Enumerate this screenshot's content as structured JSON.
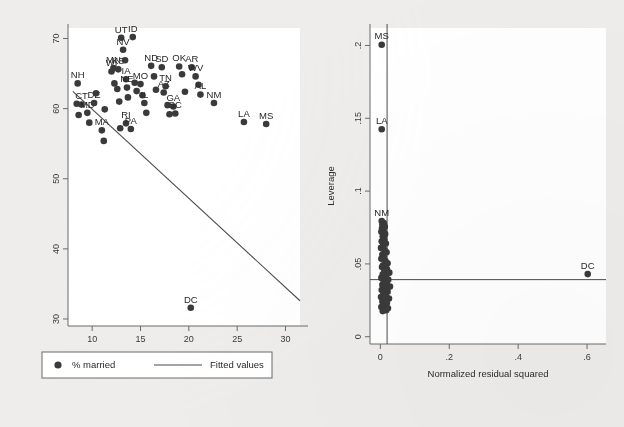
{
  "figure": {
    "background_color": "#eeedeb",
    "plot_background_color": "#ffffff",
    "marker_color": "#3a3a3a",
    "line_color": "#4a4a4a",
    "axis_color": "#6b6b6b"
  },
  "chart_data": [
    {
      "id": "left-panel",
      "type": "scatter",
      "title": "",
      "xlabel": "% in poverty",
      "ylabel": "",
      "xlim": [
        7.5,
        31.5
      ],
      "ylim": [
        29,
        71.5
      ],
      "xticks": [
        "10",
        "15",
        "20",
        "25",
        "30"
      ],
      "xtick_values": [
        10,
        15,
        20,
        25,
        30
      ],
      "yticks": [
        "30",
        "40",
        "50",
        "60",
        "70"
      ],
      "ytick_values": [
        30,
        40,
        50,
        60,
        70
      ],
      "grid": false,
      "legend_position": "below-axis",
      "legend": [
        {
          "label": "% married",
          "marker": "filled-circle"
        },
        {
          "label": "Fitted values",
          "marker": "line"
        }
      ],
      "fit_line": {
        "x": [
          8.0,
          31.5
        ],
        "y": [
          62.45,
          32.6
        ],
        "note": "fitted values line"
      },
      "points": [
        {
          "label": "NH",
          "x": 8.5,
          "y": 63.6
        },
        {
          "label": "",
          "x": 8.4,
          "y": 60.7
        },
        {
          "label": "",
          "x": 8.6,
          "y": 59.1
        },
        {
          "label": "CT",
          "x": 8.9,
          "y": 60.6
        },
        {
          "label": "MD",
          "x": 9.5,
          "y": 59.4
        },
        {
          "label": "",
          "x": 9.7,
          "y": 58.0
        },
        {
          "label": "DE",
          "x": 10.2,
          "y": 60.8
        },
        {
          "label": "",
          "x": 10.4,
          "y": 62.2
        },
        {
          "label": "MA",
          "x": 11.0,
          "y": 56.9
        },
        {
          "label": "",
          "x": 11.2,
          "y": 55.4
        },
        {
          "label": "",
          "x": 11.3,
          "y": 59.9
        },
        {
          "label": "WI",
          "x": 12.0,
          "y": 65.3
        },
        {
          "label": "MN",
          "x": 12.2,
          "y": 65.8
        },
        {
          "label": "",
          "x": 12.3,
          "y": 63.6
        },
        {
          "label": "KS",
          "x": 12.7,
          "y": 65.6
        },
        {
          "label": "",
          "x": 12.6,
          "y": 62.8
        },
        {
          "label": "",
          "x": 12.8,
          "y": 61.0
        },
        {
          "label": "",
          "x": 12.9,
          "y": 57.2
        },
        {
          "label": "NV",
          "x": 13.2,
          "y": 68.4
        },
        {
          "label": "",
          "x": 13.4,
          "y": 66.9
        },
        {
          "label": "IA",
          "x": 13.5,
          "y": 64.2
        },
        {
          "label": "NE",
          "x": 13.6,
          "y": 63.0
        },
        {
          "label": "",
          "x": 13.7,
          "y": 61.6
        },
        {
          "label": "RI",
          "x": 13.5,
          "y": 57.9
        },
        {
          "label": "PA",
          "x": 14.0,
          "y": 57.1
        },
        {
          "label": "UT",
          "x": 13.0,
          "y": 70.1
        },
        {
          "label": "ID",
          "x": 14.2,
          "y": 70.2
        },
        {
          "label": "",
          "x": 14.4,
          "y": 63.7
        },
        {
          "label": "",
          "x": 14.6,
          "y": 62.5
        },
        {
          "label": "MO",
          "x": 15.0,
          "y": 63.5
        },
        {
          "label": "",
          "x": 15.2,
          "y": 61.9
        },
        {
          "label": "IL",
          "x": 15.4,
          "y": 60.8
        },
        {
          "label": "",
          "x": 15.6,
          "y": 59.4
        },
        {
          "label": "ND",
          "x": 16.1,
          "y": 66.1
        },
        {
          "label": "",
          "x": 16.4,
          "y": 64.6
        },
        {
          "label": "",
          "x": 16.6,
          "y": 62.7
        },
        {
          "label": "SD",
          "x": 17.2,
          "y": 65.9
        },
        {
          "label": "AZ",
          "x": 17.4,
          "y": 62.3
        },
        {
          "label": "TN",
          "x": 17.6,
          "y": 63.2
        },
        {
          "label": "",
          "x": 17.8,
          "y": 60.5
        },
        {
          "label": "",
          "x": 18.0,
          "y": 59.2
        },
        {
          "label": "GA",
          "x": 18.4,
          "y": 60.3
        },
        {
          "label": "SC",
          "x": 18.6,
          "y": 59.3
        },
        {
          "label": "OK",
          "x": 19.0,
          "y": 66.0
        },
        {
          "label": "",
          "x": 19.3,
          "y": 64.9
        },
        {
          "label": "",
          "x": 19.6,
          "y": 62.4
        },
        {
          "label": "AR",
          "x": 20.3,
          "y": 65.9
        },
        {
          "label": "WV",
          "x": 20.7,
          "y": 64.6
        },
        {
          "label": "",
          "x": 21.0,
          "y": 63.4
        },
        {
          "label": "AL",
          "x": 21.2,
          "y": 62.0
        },
        {
          "label": "NM",
          "x": 22.6,
          "y": 60.8
        },
        {
          "label": "LA",
          "x": 25.7,
          "y": 58.1
        },
        {
          "label": "MS",
          "x": 28.0,
          "y": 57.8
        },
        {
          "label": "DC",
          "x": 20.2,
          "y": 31.6
        }
      ],
      "annotated_labels": [
        "NH",
        "CT",
        "MD",
        "DE",
        "MA",
        "WI",
        "MN",
        "KS",
        "NV",
        "IA",
        "NE",
        "RI",
        "PA",
        "UT",
        "ID",
        "MO",
        "IL",
        "ND",
        "SD",
        "AZ",
        "TN",
        "GA",
        "SC",
        "OK",
        "AR",
        "WV",
        "AL",
        "NM",
        "LA",
        "MS",
        "DC"
      ]
    },
    {
      "id": "right-panel",
      "type": "scatter",
      "title": "",
      "xlabel": "Normalized residual squared",
      "ylabel": "Leverage",
      "xlim": [
        -0.03,
        0.655
      ],
      "ylim": [
        -0.005,
        0.212
      ],
      "xticks": [
        "0",
        ".2",
        ".4",
        ".6"
      ],
      "xtick_values": [
        0,
        0.2,
        0.4,
        0.6
      ],
      "yticks": [
        "0",
        ".05",
        ".1",
        ".15",
        ".2"
      ],
      "ytick_values": [
        0,
        0.05,
        0.1,
        0.15,
        0.2
      ],
      "grid": false,
      "reference_lines": {
        "horizontal_y": 0.0392,
        "vertical_x": 0.0196
      },
      "points": [
        {
          "label": "MS",
          "x": 0.004,
          "y": 0.2005
        },
        {
          "label": "LA",
          "x": 0.004,
          "y": 0.1425
        },
        {
          "label": "NM",
          "x": 0.004,
          "y": 0.0795
        },
        {
          "label": "",
          "x": 0.01,
          "y": 0.078
        },
        {
          "label": "",
          "x": 0.006,
          "y": 0.077
        },
        {
          "label": "",
          "x": 0.013,
          "y": 0.0755
        },
        {
          "label": "",
          "x": 0.005,
          "y": 0.0745
        },
        {
          "label": "",
          "x": 0.009,
          "y": 0.073
        },
        {
          "label": "",
          "x": 0.003,
          "y": 0.072
        },
        {
          "label": "",
          "x": 0.014,
          "y": 0.0705
        },
        {
          "label": "",
          "x": 0.007,
          "y": 0.069
        },
        {
          "label": "",
          "x": 0.011,
          "y": 0.067
        },
        {
          "label": "",
          "x": 0.004,
          "y": 0.0655
        },
        {
          "label": "",
          "x": 0.016,
          "y": 0.064
        },
        {
          "label": "",
          "x": 0.008,
          "y": 0.0625
        },
        {
          "label": "",
          "x": 0.002,
          "y": 0.061
        },
        {
          "label": "",
          "x": 0.012,
          "y": 0.0595
        },
        {
          "label": "",
          "x": 0.018,
          "y": 0.058
        },
        {
          "label": "",
          "x": 0.006,
          "y": 0.0565
        },
        {
          "label": "",
          "x": 0.01,
          "y": 0.055
        },
        {
          "label": "",
          "x": 0.003,
          "y": 0.0535
        },
        {
          "label": "",
          "x": 0.015,
          "y": 0.052
        },
        {
          "label": "",
          "x": 0.021,
          "y": 0.0505
        },
        {
          "label": "",
          "x": 0.008,
          "y": 0.049
        },
        {
          "label": "",
          "x": 0.005,
          "y": 0.0478
        },
        {
          "label": "",
          "x": 0.019,
          "y": 0.0465
        },
        {
          "label": "",
          "x": 0.012,
          "y": 0.0452
        },
        {
          "label": "",
          "x": 0.026,
          "y": 0.044
        },
        {
          "label": "",
          "x": 0.007,
          "y": 0.0428
        },
        {
          "label": "",
          "x": 0.016,
          "y": 0.0416
        },
        {
          "label": "",
          "x": 0.003,
          "y": 0.0404
        },
        {
          "label": "",
          "x": 0.023,
          "y": 0.0392
        },
        {
          "label": "",
          "x": 0.01,
          "y": 0.038
        },
        {
          "label": "",
          "x": 0.018,
          "y": 0.0368
        },
        {
          "label": "",
          "x": 0.006,
          "y": 0.0356
        },
        {
          "label": "",
          "x": 0.028,
          "y": 0.0344
        },
        {
          "label": "",
          "x": 0.013,
          "y": 0.0332
        },
        {
          "label": "",
          "x": 0.004,
          "y": 0.032
        },
        {
          "label": "",
          "x": 0.021,
          "y": 0.0308
        },
        {
          "label": "",
          "x": 0.009,
          "y": 0.0296
        },
        {
          "label": "",
          "x": 0.016,
          "y": 0.0284
        },
        {
          "label": "",
          "x": 0.002,
          "y": 0.0272
        },
        {
          "label": "",
          "x": 0.025,
          "y": 0.0262
        },
        {
          "label": "",
          "x": 0.011,
          "y": 0.0252
        },
        {
          "label": "",
          "x": 0.006,
          "y": 0.0242
        },
        {
          "label": "",
          "x": 0.019,
          "y": 0.0232
        },
        {
          "label": "",
          "x": 0.014,
          "y": 0.0222
        },
        {
          "label": "",
          "x": 0.008,
          "y": 0.0212
        },
        {
          "label": "",
          "x": 0.003,
          "y": 0.0204
        },
        {
          "label": "",
          "x": 0.022,
          "y": 0.0196
        },
        {
          "label": "",
          "x": 0.012,
          "y": 0.0188
        },
        {
          "label": "",
          "x": 0.017,
          "y": 0.0182
        },
        {
          "label": "",
          "x": 0.007,
          "y": 0.0176
        },
        {
          "label": "DC",
          "x": 0.602,
          "y": 0.043
        }
      ],
      "annotated_labels": [
        "MS",
        "LA",
        "NM",
        "DC"
      ]
    }
  ],
  "left_panel": {
    "xlabel": "% in poverty",
    "xticks": [
      "10",
      "15",
      "20",
      "25",
      "30"
    ],
    "yticks": [
      "30",
      "40",
      "50",
      "60",
      "70"
    ],
    "legend": {
      "marker_label": "% married",
      "line_label": "Fitted values"
    }
  },
  "right_panel": {
    "xlabel": "Normalized residual squared",
    "ylabel": "Leverage",
    "xticks": [
      "0",
      ".2",
      ".4",
      ".6"
    ],
    "yticks": [
      "0",
      ".05",
      ".1",
      ".15",
      ".2"
    ]
  }
}
